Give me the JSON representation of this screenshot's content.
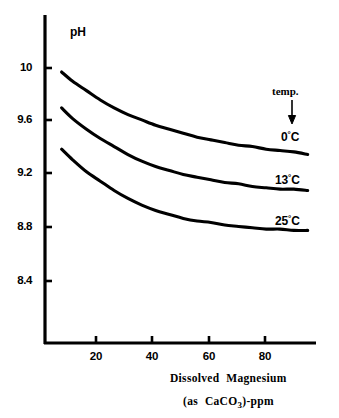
{
  "chart_data": {
    "type": "line",
    "title": "",
    "xlabel": "Dissolved Magnesium (as CaCO3)-ppm",
    "ylabel": "pH",
    "xlim": [
      0,
      98
    ],
    "ylim": [
      8.25,
      10.18
    ],
    "grid": false,
    "legend_position": "inline-right",
    "xticks": [
      20,
      40,
      60,
      80
    ],
    "yticks": [
      "8.4",
      "8.8",
      "9.2",
      "9.6",
      "10"
    ],
    "annotations": [
      {
        "text": "temp.",
        "note": "arrow pointing down toward series labels ordered 0C, 13C, 25C"
      }
    ],
    "series": [
      {
        "name": "0°C",
        "label_main": "0",
        "label_deg": "°",
        "label_unit": "C",
        "x": [
          6,
          10,
          15,
          20,
          25,
          30,
          35,
          40,
          45,
          50,
          55,
          60,
          65,
          70,
          75,
          80,
          85,
          90,
          95
        ],
        "y": [
          9.97,
          9.9,
          9.83,
          9.76,
          9.7,
          9.65,
          9.61,
          9.57,
          9.54,
          9.51,
          9.48,
          9.46,
          9.44,
          9.42,
          9.41,
          9.39,
          9.38,
          9.37,
          9.35
        ]
      },
      {
        "name": "13°C",
        "label_main": "13",
        "label_deg": "°",
        "label_unit": "C",
        "x": [
          6,
          10,
          15,
          20,
          25,
          30,
          35,
          40,
          45,
          50,
          55,
          60,
          65,
          70,
          75,
          80,
          85,
          90,
          95
        ],
        "y": [
          9.7,
          9.62,
          9.54,
          9.47,
          9.41,
          9.35,
          9.3,
          9.26,
          9.23,
          9.2,
          9.18,
          9.16,
          9.14,
          9.13,
          9.11,
          9.1,
          9.09,
          9.09,
          9.08
        ]
      },
      {
        "name": "25°C",
        "label_main": "25",
        "label_deg": "°",
        "label_unit": "C",
        "x": [
          6,
          10,
          15,
          20,
          25,
          30,
          35,
          40,
          45,
          50,
          55,
          60,
          65,
          70,
          75,
          80,
          85,
          90,
          95
        ],
        "y": [
          9.39,
          9.31,
          9.22,
          9.15,
          9.08,
          9.02,
          8.97,
          8.93,
          8.9,
          8.87,
          8.85,
          8.84,
          8.82,
          8.81,
          8.8,
          8.79,
          8.79,
          8.78,
          8.78
        ]
      }
    ]
  },
  "axes": {
    "y_label": "pH",
    "y_ticks": [
      {
        "label": "10"
      },
      {
        "label": "9.6"
      },
      {
        "label": "9.2"
      },
      {
        "label": "8.8"
      },
      {
        "label": "8.4"
      }
    ],
    "x_ticks": [
      {
        "label": "20"
      },
      {
        "label": "40"
      },
      {
        "label": "60"
      },
      {
        "label": "80"
      }
    ],
    "x_title_line1_word1": "Dissolved",
    "x_title_line1_word2": "Magnesium",
    "x_title_line2_open": "(as",
    "x_title_line2_formula_pre": "CaCO",
    "x_title_line2_formula_sub": "3",
    "x_title_line2_close": ")-ppm"
  },
  "legend": {
    "caption": "temp.",
    "entries": [
      {
        "main": "0",
        "deg": "°",
        "unit": "C"
      },
      {
        "main": "13",
        "deg": "°",
        "unit": "C"
      },
      {
        "main": "25",
        "deg": "°",
        "unit": "C"
      }
    ]
  },
  "style": {
    "ink": "#000000",
    "paper": "#ffffff"
  }
}
